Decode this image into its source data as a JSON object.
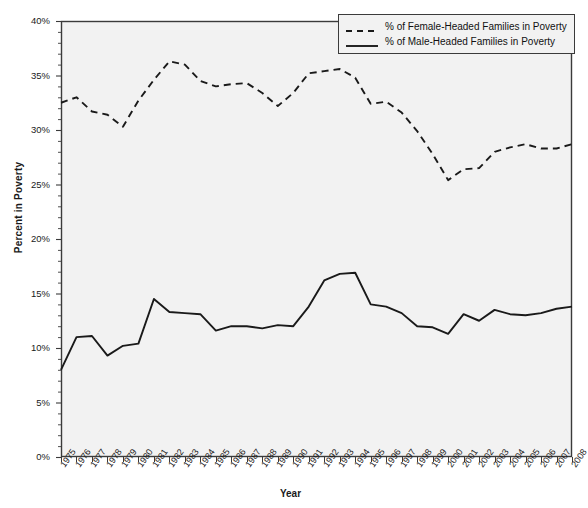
{
  "chart_data": {
    "type": "line",
    "title": "",
    "xlabel": "Year",
    "ylabel": "Percent in Poverty",
    "grid": false,
    "legend_position": "top-right",
    "xlim": [
      1975,
      2008
    ],
    "ylim": [
      0,
      40
    ],
    "ytick_labels": [
      "0%",
      "5%",
      "10%",
      "15%",
      "20%",
      "25%",
      "30%",
      "35%",
      "40%"
    ],
    "ytick_values": [
      0,
      5,
      10,
      15,
      20,
      25,
      30,
      35,
      40
    ],
    "yminor_step": 1,
    "categories": [
      "1975",
      "1976",
      "1977",
      "1978",
      "1979",
      "1980",
      "1981",
      "1982",
      "1983",
      "1984",
      "1985",
      "1986",
      "1987",
      "1988",
      "1989",
      "1990",
      "1991",
      "1992",
      "1993",
      "1994",
      "1995",
      "1996",
      "1997",
      "1998",
      "1999",
      "2000",
      "2001",
      "2002",
      "2003",
      "2004",
      "2005",
      "2006",
      "2007",
      "2008"
    ],
    "series": [
      {
        "name": "% of Female-Headed Families in Poverty",
        "style": "dashed",
        "color": "#1a1a1a",
        "values": [
          32.5,
          33.0,
          31.7,
          31.4,
          30.3,
          32.7,
          34.6,
          36.3,
          36.0,
          34.5,
          34.0,
          34.2,
          34.3,
          33.4,
          32.2,
          33.4,
          35.2,
          35.4,
          35.6,
          34.8,
          32.4,
          32.6,
          31.6,
          29.9,
          27.8,
          25.4,
          26.4,
          26.5,
          28.0,
          28.4,
          28.7,
          28.3,
          28.3,
          28.7
        ]
      },
      {
        "name": "% of Male-Headed Families in Poverty",
        "style": "solid",
        "color": "#1a1a1a",
        "values": [
          8.0,
          11.0,
          11.1,
          9.3,
          10.2,
          10.4,
          14.5,
          13.3,
          13.2,
          13.1,
          11.6,
          12.0,
          12.0,
          11.8,
          12.1,
          12.0,
          13.8,
          16.2,
          16.8,
          16.9,
          14.0,
          13.8,
          13.2,
          12.0,
          11.9,
          11.3,
          13.1,
          12.5,
          13.5,
          13.1,
          13.0,
          13.2,
          13.6,
          13.8
        ]
      }
    ]
  },
  "legend": {
    "items": [
      {
        "label": "% of Female-Headed Families in Poverty",
        "style": "dashed"
      },
      {
        "label": "% of Male-Headed Families in Poverty",
        "style": "solid"
      }
    ]
  },
  "axes": {
    "x_title": "Year",
    "y_title": "Percent in Poverty"
  },
  "colors": {
    "plot_background": "#f2f2f2",
    "line": "#1a1a1a",
    "frame": "#3b3b3b",
    "text": "#1a1a1a"
  }
}
